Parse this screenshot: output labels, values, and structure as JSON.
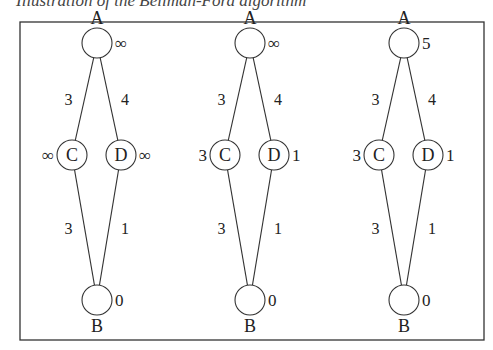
{
  "caption": "Illustration of the Bellman-Ford algorithm",
  "frame": {
    "x": 20,
    "y": 22,
    "width": 464,
    "height": 318
  },
  "colors": {
    "stroke": "#333333",
    "text": "#222222",
    "background": "#ffffff"
  },
  "panels": [
    {
      "id": "step-1",
      "nodes": [
        {
          "name": "A",
          "cx": 97,
          "cy": 43,
          "label_pos": "above",
          "dist": "∞",
          "dist_side": "right"
        },
        {
          "name": "C",
          "cx": 72,
          "cy": 155,
          "label_pos": "inside",
          "dist": "∞",
          "dist_side": "left"
        },
        {
          "name": "D",
          "cx": 121,
          "cy": 155,
          "label_pos": "inside",
          "dist": "∞",
          "dist_side": "right"
        },
        {
          "name": "B",
          "cx": 97,
          "cy": 300,
          "label_pos": "below",
          "dist": "0",
          "dist_side": "right"
        }
      ],
      "edges": [
        {
          "from": "A",
          "to": "C",
          "weight": "3"
        },
        {
          "from": "A",
          "to": "D",
          "weight": "4"
        },
        {
          "from": "C",
          "to": "B",
          "weight": "3"
        },
        {
          "from": "D",
          "to": "B",
          "weight": "1"
        }
      ]
    },
    {
      "id": "step-2",
      "nodes": [
        {
          "name": "A",
          "cx": 250,
          "cy": 43,
          "label_pos": "above",
          "dist": "∞",
          "dist_side": "right"
        },
        {
          "name": "C",
          "cx": 225,
          "cy": 155,
          "label_pos": "inside",
          "dist": "3",
          "dist_side": "left"
        },
        {
          "name": "D",
          "cx": 274,
          "cy": 155,
          "label_pos": "inside",
          "dist": "1",
          "dist_side": "right"
        },
        {
          "name": "B",
          "cx": 250,
          "cy": 300,
          "label_pos": "below",
          "dist": "0",
          "dist_side": "right"
        }
      ],
      "edges": [
        {
          "from": "A",
          "to": "C",
          "weight": "3"
        },
        {
          "from": "A",
          "to": "D",
          "weight": "4"
        },
        {
          "from": "C",
          "to": "B",
          "weight": "3"
        },
        {
          "from": "D",
          "to": "B",
          "weight": "1"
        }
      ]
    },
    {
      "id": "step-3",
      "nodes": [
        {
          "name": "A",
          "cx": 404,
          "cy": 43,
          "label_pos": "above",
          "dist": "5",
          "dist_side": "right"
        },
        {
          "name": "C",
          "cx": 379,
          "cy": 155,
          "label_pos": "inside",
          "dist": "3",
          "dist_side": "left"
        },
        {
          "name": "D",
          "cx": 428,
          "cy": 155,
          "label_pos": "inside",
          "dist": "1",
          "dist_side": "right"
        },
        {
          "name": "B",
          "cx": 404,
          "cy": 300,
          "label_pos": "below",
          "dist": "0",
          "dist_side": "right"
        }
      ],
      "edges": [
        {
          "from": "A",
          "to": "C",
          "weight": "3"
        },
        {
          "from": "A",
          "to": "D",
          "weight": "4"
        },
        {
          "from": "C",
          "to": "B",
          "weight": "3"
        },
        {
          "from": "D",
          "to": "B",
          "weight": "1"
        }
      ]
    }
  ]
}
